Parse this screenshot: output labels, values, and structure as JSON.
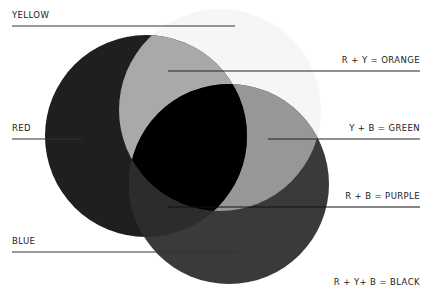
{
  "diagram": {
    "colors": {
      "background": "#ffffff",
      "yellow": "#f6f6f6",
      "red": "#1f1f1f",
      "blue": "#3a3a3a",
      "orange": "#a9a9a9",
      "green": "#979797",
      "purple": "#2c2c2c",
      "black": "#000000"
    },
    "labels": {
      "yellow": "YELLOW",
      "red": "RED",
      "blue": "BLUE",
      "orange": "R + Y = ORANGE",
      "green": "Y + B = GREEN",
      "purple": "R + B = PURPLE",
      "black": "R + Y+ B = BLACK"
    }
  }
}
